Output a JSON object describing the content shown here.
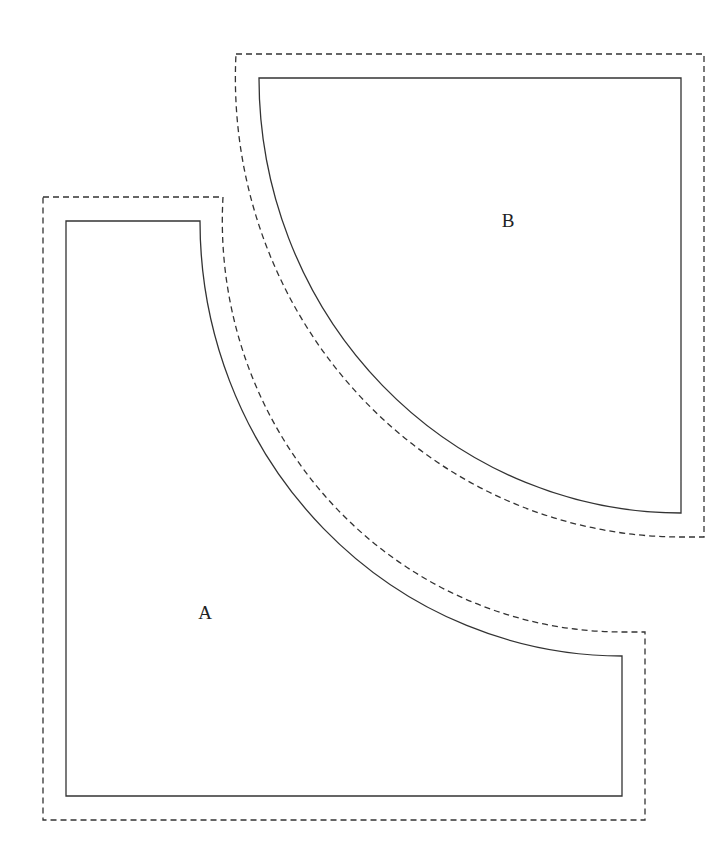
{
  "diagram": {
    "type": "pattern-pieces",
    "colors": {
      "line": "#333333",
      "label": "#222222",
      "background": "#ffffff"
    },
    "pieces": [
      {
        "id": "A",
        "label": "A",
        "shape": "rectangle with concave quarter-circle cut from top-right corner",
        "label_position": [
          205,
          619
        ]
      },
      {
        "id": "B",
        "label": "B",
        "shape": "convex quarter circle",
        "label_position": [
          508,
          227
        ]
      }
    ]
  }
}
